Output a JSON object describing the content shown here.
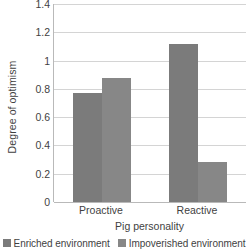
{
  "chart_data": {
    "type": "bar",
    "title": "",
    "xlabel": "Pig personality",
    "ylabel": "Degree of optimism",
    "categories": [
      "Proactive",
      "Reactive"
    ],
    "series": [
      {
        "name": "Enriched environment",
        "color": "#7b7b7b",
        "values": [
          0.77,
          1.12
        ]
      },
      {
        "name": "Impoverished environment",
        "color": "#878787",
        "values": [
          0.88,
          0.28
        ]
      }
    ],
    "ylim": [
      0,
      1.4
    ],
    "ytick_values": [
      0,
      0.2,
      0.4,
      0.6,
      0.8,
      1,
      1.2,
      1.4
    ],
    "ytick_labels": [
      "0",
      "0.2",
      "0.4",
      "0.6",
      "0.8",
      "1",
      "1.2",
      "1.4"
    ],
    "grid": true,
    "grid_color": "#d4d4d4",
    "axis_color": "#b9b9b9",
    "legend_position": "bottom",
    "background": "#ffffff"
  }
}
